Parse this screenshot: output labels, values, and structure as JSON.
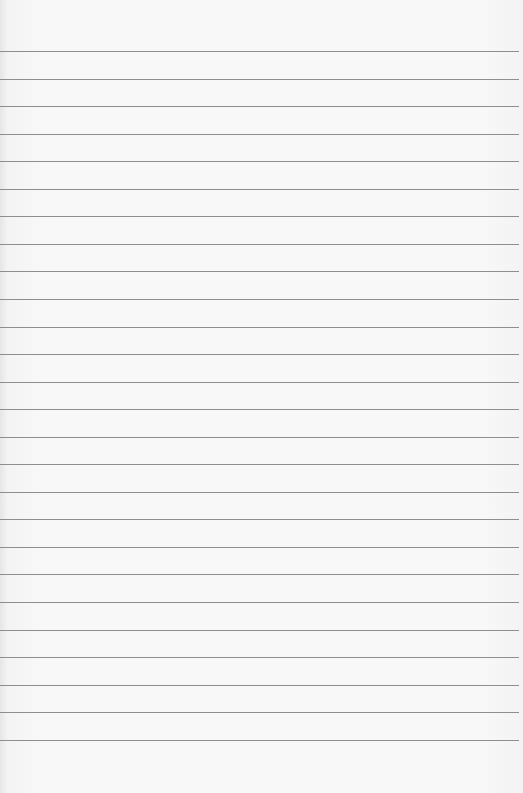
{
  "paper": {
    "type": "lined-paper",
    "line_count": 26,
    "first_line_y": 51,
    "line_spacing": 27.55,
    "line_color": "#8e8e8e",
    "background_color": "#f8f8f8"
  }
}
